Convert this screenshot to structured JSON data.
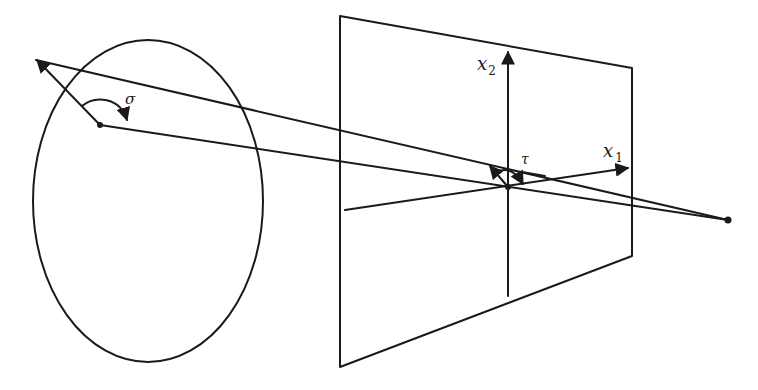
{
  "diagram": {
    "type": "projection-geometry",
    "labels": {
      "sigma": "σ",
      "tau": "τ",
      "x1_base": "x",
      "x1_sub": "1",
      "x2_base": "x",
      "x2_sub": "2"
    },
    "elements": {
      "ellipse": {
        "cx": 148,
        "cy": 201,
        "rx": 115,
        "ry": 161
      },
      "plane": {
        "top_left": [
          340,
          16
        ],
        "top_right": [
          632,
          68
        ],
        "bottom_right": [
          632,
          256
        ],
        "bottom_left": [
          340,
          367
        ]
      },
      "x1_axis": {
        "from": [
          345,
          210
        ],
        "to": [
          630,
          168
        ]
      },
      "x2_axis": {
        "from": [
          508,
          296
        ],
        "to": [
          508,
          50
        ]
      },
      "origin": [
        508,
        187
      ],
      "sphere_point": [
        100,
        125
      ],
      "outer_arrow_tip": [
        34,
        59
      ],
      "projection_center": [
        728,
        220
      ]
    },
    "colors": {
      "ink": "#1a1a1a",
      "background": "#ffffff"
    }
  }
}
